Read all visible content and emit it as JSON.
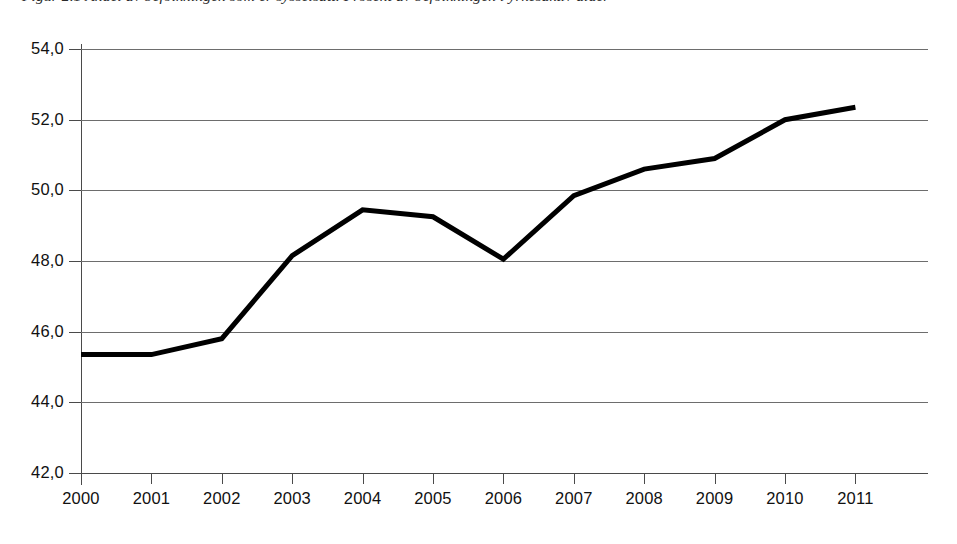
{
  "figure": {
    "caption": "Figur 2.1  Andel av befolkningen som er sysselsatt. Prosent av befolkningen i yrkesaktiv alder",
    "caption_visible": "cut off at top edge of image"
  },
  "chart_data": {
    "type": "line",
    "title": "",
    "xlabel": "",
    "ylabel": "",
    "categories": [
      "2000",
      "2001",
      "2002",
      "2003",
      "2004",
      "2005",
      "2006",
      "2007",
      "2008",
      "2009",
      "2010",
      "2011"
    ],
    "values": [
      45.35,
      45.35,
      45.8,
      48.15,
      49.45,
      49.25,
      48.05,
      49.85,
      50.6,
      50.9,
      52.0,
      52.35
    ],
    "series": [
      {
        "name": "",
        "values": [
          45.35,
          45.35,
          45.8,
          48.15,
          49.45,
          49.25,
          48.05,
          49.85,
          50.6,
          50.9,
          52.0,
          52.35
        ]
      }
    ],
    "ylim": [
      42.0,
      54.0
    ],
    "ytick_step": 2.0,
    "ytick_labels": [
      "54,0",
      "52,0",
      "50,0",
      "48,0",
      "46,0",
      "44,0",
      "42,0"
    ],
    "ytick_values": [
      54.0,
      52.0,
      50.0,
      48.0,
      46.0,
      44.0,
      42.0
    ],
    "xtick_labels": [
      "2000",
      "2001",
      "2002",
      "2003",
      "2004",
      "2005",
      "2006",
      "2007",
      "2008",
      "2009",
      "2010",
      "2011"
    ],
    "decimal_separator": ",",
    "grid": "horizontal",
    "legend": "none",
    "line_color": "#000000",
    "line_width_px": 5,
    "grid_color": "#6d6d6d",
    "axis_color": "#4a4a4a",
    "background": "#ffffff"
  }
}
